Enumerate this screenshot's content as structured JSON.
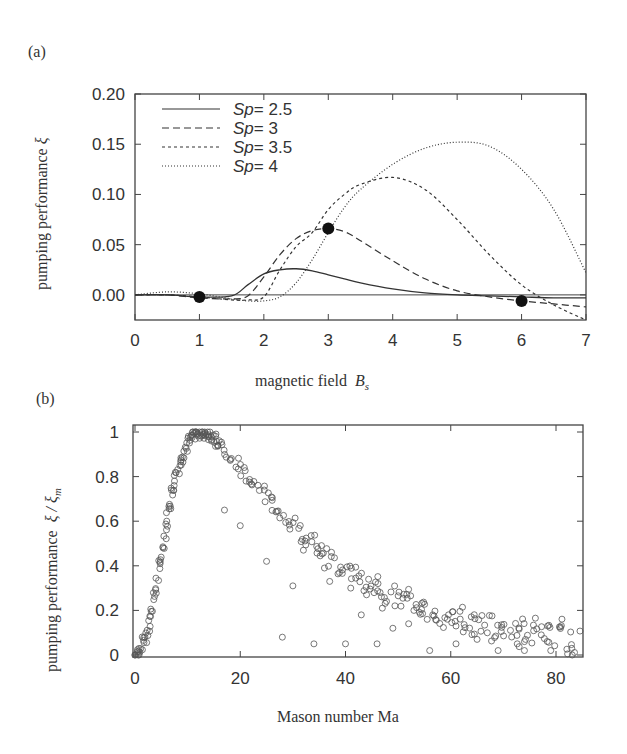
{
  "panels": {
    "a": {
      "label": "(a)",
      "xlabel": "magnetic field",
      "xlabel_sym": "B",
      "xlabel_sub": "s",
      "ylabel": "pumping performance",
      "ylabel_sym": "ξ"
    },
    "b": {
      "label": "(b)",
      "xlabel": "Mason number Ma",
      "ylabel": "pumping performance",
      "ylabel_sym": "ξ / ξ",
      "ylabel_sub": "m"
    }
  },
  "chart_data": [
    {
      "type": "line",
      "title": "(a)",
      "xlabel": "magnetic field B_s",
      "ylabel": "pumping performance ξ",
      "xlim": [
        0,
        7
      ],
      "ylim": [
        -0.025,
        0.2
      ],
      "xticks": [
        0,
        1,
        2,
        3,
        4,
        5,
        6,
        7
      ],
      "yticks": [
        0.0,
        0.05,
        0.1,
        0.15,
        0.2
      ],
      "ytick_labels": [
        "0.00",
        "0.05",
        "0.10",
        "0.15",
        "0.20"
      ],
      "legend_position": "upper left",
      "grid": false,
      "x": [
        0,
        0.5,
        1.0,
        1.5,
        1.75,
        2.0,
        2.25,
        2.5,
        2.75,
        3.0,
        3.25,
        3.5,
        4.0,
        4.5,
        5.0,
        5.5,
        6.0,
        6.5,
        7.0
      ],
      "series": [
        {
          "name": "Sp = 2.5",
          "style": "solid",
          "values": [
            0,
            0,
            -0.002,
            -0.001,
            0.01,
            0.021,
            0.025,
            0.026,
            0.024,
            0.02,
            0.016,
            0.012,
            0.006,
            0.002,
            0.0,
            -0.001,
            -0.002,
            -0.003,
            -0.003
          ]
        },
        {
          "name": "Sp = 3",
          "style": "dashed",
          "values": [
            0,
            0,
            -0.003,
            -0.004,
            -0.001,
            0.018,
            0.04,
            0.056,
            0.064,
            0.066,
            0.063,
            0.054,
            0.034,
            0.016,
            0.004,
            -0.002,
            -0.006,
            -0.009,
            -0.012
          ]
        },
        {
          "name": "Sp = 3.5",
          "style": "dashed-short",
          "values": [
            0,
            0,
            -0.002,
            -0.005,
            -0.005,
            -0.002,
            0.025,
            0.048,
            0.062,
            0.085,
            0.1,
            0.11,
            0.117,
            0.105,
            0.075,
            0.04,
            0.01,
            -0.01,
            -0.025
          ]
        },
        {
          "name": "Sp = 4",
          "style": "dotted",
          "values": [
            0,
            0.003,
            0.001,
            -0.004,
            -0.006,
            -0.006,
            -0.002,
            0.012,
            0.035,
            0.062,
            0.087,
            0.105,
            0.13,
            0.146,
            0.152,
            0.148,
            0.125,
            0.085,
            0.022
          ]
        }
      ],
      "markers": [
        {
          "x": 1,
          "y": -0.002
        },
        {
          "x": 3,
          "y": 0.066
        },
        {
          "x": 6,
          "y": -0.006
        }
      ]
    },
    {
      "type": "scatter",
      "title": "(b)",
      "xlabel": "Mason number Ma",
      "ylabel": "pumping performance ξ / ξm",
      "xlim": [
        0,
        84
      ],
      "ylim": [
        0,
        1.02
      ],
      "xticks": [
        0,
        20,
        40,
        60,
        80
      ],
      "yticks": [
        0,
        0.2,
        0.4,
        0.6,
        0.8,
        1
      ],
      "ytick_labels": [
        "0",
        "0.2",
        "0.4",
        "0.6",
        "0.8",
        "1"
      ],
      "marker": "open-circle",
      "grid": false,
      "main_branch": {
        "x": [
          0,
          1,
          2,
          3,
          4,
          5,
          6,
          7,
          8,
          9,
          10,
          11,
          12,
          13,
          14,
          15,
          16,
          18,
          20,
          22,
          24,
          26,
          28,
          30,
          32,
          34,
          36,
          38,
          40,
          42,
          44,
          46,
          48,
          50,
          52,
          54,
          56,
          58,
          60,
          62,
          64,
          66,
          68,
          70,
          72,
          74,
          76,
          78,
          80,
          82,
          84
        ],
        "y": [
          0,
          0.02,
          0.08,
          0.18,
          0.3,
          0.45,
          0.6,
          0.72,
          0.82,
          0.9,
          0.95,
          0.99,
          1.0,
          1.0,
          0.99,
          0.97,
          0.95,
          0.9,
          0.85,
          0.8,
          0.75,
          0.7,
          0.65,
          0.6,
          0.55,
          0.51,
          0.47,
          0.43,
          0.4,
          0.37,
          0.34,
          0.31,
          0.29,
          0.27,
          0.25,
          0.23,
          0.21,
          0.2,
          0.19,
          0.17,
          0.16,
          0.15,
          0.14,
          0.13,
          0.12,
          0.12,
          0.11,
          0.1,
          0.1,
          0.09,
          0.09
        ]
      },
      "scattered_points": [
        [
          20,
          0.58
        ],
        [
          17,
          0.65
        ],
        [
          25,
          0.42
        ],
        [
          28,
          0.08
        ],
        [
          30,
          0.31
        ],
        [
          32,
          0.47
        ],
        [
          34,
          0.05
        ],
        [
          36,
          0.39
        ],
        [
          37,
          0.33
        ],
        [
          40,
          0.05
        ],
        [
          41,
          0.3
        ],
        [
          43,
          0.18
        ],
        [
          44,
          0.27
        ],
        [
          46,
          0.05
        ],
        [
          47,
          0.21
        ],
        [
          49,
          0.12
        ],
        [
          52,
          0.14
        ],
        [
          53,
          0.2
        ],
        [
          56,
          0.02
        ],
        [
          61,
          0.13
        ],
        [
          61,
          0.05
        ],
        [
          65,
          0.07
        ],
        [
          69,
          0.02
        ],
        [
          74,
          0.06
        ],
        [
          74,
          0.02
        ],
        [
          79,
          0.02
        ],
        [
          83,
          0.03
        ]
      ]
    }
  ]
}
